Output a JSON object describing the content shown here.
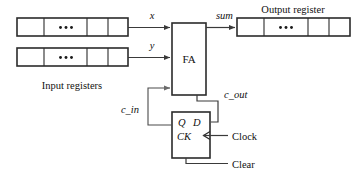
{
  "diagram": {
    "labels": {
      "input_registers": "Input registers",
      "output_register": "Output register",
      "fa": "FA",
      "x": "x",
      "y": "y",
      "sum": "sum",
      "c_in": "c_in",
      "c_out": "c_out",
      "q": "Q",
      "d": "D",
      "ck": "CK",
      "clock": "Clock",
      "clear": "Clear",
      "ellipsis": "•••"
    },
    "colors": {
      "stroke_box": "#2b2b2b",
      "stroke_wire": "#4a4a4a",
      "text": "#111111",
      "background": "#ffffff"
    },
    "blocks": [
      {
        "name": "input-register-x",
        "label": "",
        "cells": 4,
        "x": 17,
        "y": 18,
        "width": 111,
        "height": 18
      },
      {
        "name": "input-register-y",
        "label": "",
        "cells": 4,
        "x": 17,
        "y": 48,
        "width": 111,
        "height": 18
      },
      {
        "name": "output-register",
        "label": "Output register",
        "cells": 4,
        "x": 237,
        "y": 18,
        "width": 113,
        "height": 18
      },
      {
        "name": "full-adder",
        "label": "FA",
        "cells": 0,
        "x": 172,
        "y": 23,
        "width": 34,
        "height": 72
      },
      {
        "name": "d-flip-flop",
        "label": "Q D / CK",
        "cells": 0,
        "x": 172,
        "y": 112,
        "width": 38,
        "height": 46
      }
    ],
    "signals": [
      {
        "name": "x",
        "label": "x",
        "from": "input-register-x",
        "to": "full-adder"
      },
      {
        "name": "y",
        "label": "y",
        "from": "input-register-y",
        "to": "full-adder"
      },
      {
        "name": "sum",
        "label": "sum",
        "from": "full-adder",
        "to": "output-register"
      },
      {
        "name": "c_out",
        "label": "c_out",
        "from": "full-adder",
        "to": "d-flip-flop"
      },
      {
        "name": "c_in",
        "label": "c_in",
        "from": "d-flip-flop",
        "to": "full-adder"
      },
      {
        "name": "clock",
        "label": "Clock",
        "from": "external",
        "to": "d-flip-flop"
      },
      {
        "name": "clear",
        "label": "Clear",
        "from": "external",
        "to": "d-flip-flop"
      }
    ]
  }
}
